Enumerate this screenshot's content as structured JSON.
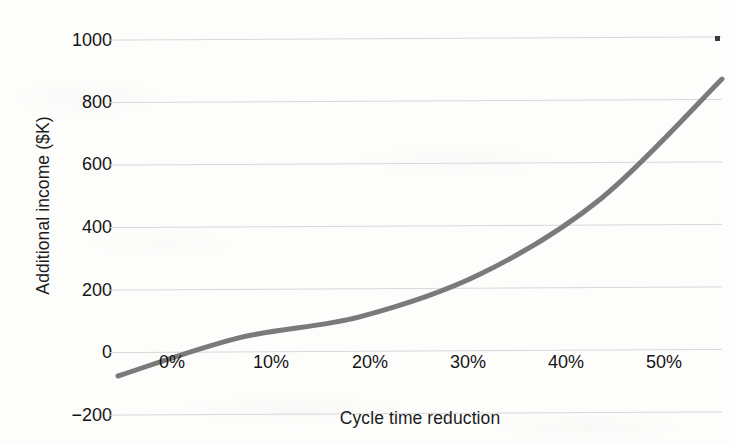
{
  "chart_data": {
    "type": "line",
    "title": "",
    "subtitle": "",
    "xlabel": "Cycle time reduction",
    "ylabel": "Additional income ($K)",
    "categories": [
      "0%",
      "10%",
      "20%",
      "30%",
      "40%",
      "50%"
    ],
    "x": [
      0,
      10,
      20,
      30,
      40,
      50
    ],
    "values": [
      -80,
      40,
      105,
      240,
      480,
      860
    ],
    "series": [
      {
        "name": "Additional income",
        "values": [
          -80,
          40,
          105,
          240,
          480,
          860
        ],
        "color": "#7a7a7a",
        "line_width": 5,
        "markers": false,
        "smooth": true
      }
    ],
    "ylim": [
      -200,
      1000
    ],
    "ytick_labels": [
      "1000",
      "800",
      "600",
      "400",
      "200",
      "0",
      "-200"
    ],
    "ytick_values": [
      1000,
      800,
      600,
      400,
      200,
      0,
      -200
    ],
    "xtick_labels": [
      "0%",
      "10%",
      "20%",
      "30%",
      "40%",
      "50%"
    ],
    "grid": true,
    "grid_axis": "y",
    "grid_color": "#d8d8d8",
    "legend": false,
    "legend_position": "none",
    "background_color": "#fdfdfc",
    "annotations": []
  },
  "axes": {
    "y_title": "Additional income ($K)",
    "x_title": "Cycle time reduction",
    "y_ticks": [
      {
        "label": "1000",
        "value": 1000
      },
      {
        "label": "800",
        "value": 800
      },
      {
        "label": "600",
        "value": 600
      },
      {
        "label": "400",
        "value": 400
      },
      {
        "label": "200",
        "value": 200
      },
      {
        "label": "0",
        "value": 0
      },
      {
        "label": "−200",
        "value": -200
      }
    ],
    "x_ticks": [
      {
        "label": "0%",
        "value": 0
      },
      {
        "label": "10%",
        "value": 10
      },
      {
        "label": "20%",
        "value": 20
      },
      {
        "label": "30%",
        "value": 30
      },
      {
        "label": "40%",
        "value": 40
      },
      {
        "label": "50%",
        "value": 50
      }
    ]
  },
  "colors": {
    "line": "#7a7a7a",
    "grid": "#d8d8d8",
    "text": "#141414",
    "background": "#fdfdfc"
  }
}
